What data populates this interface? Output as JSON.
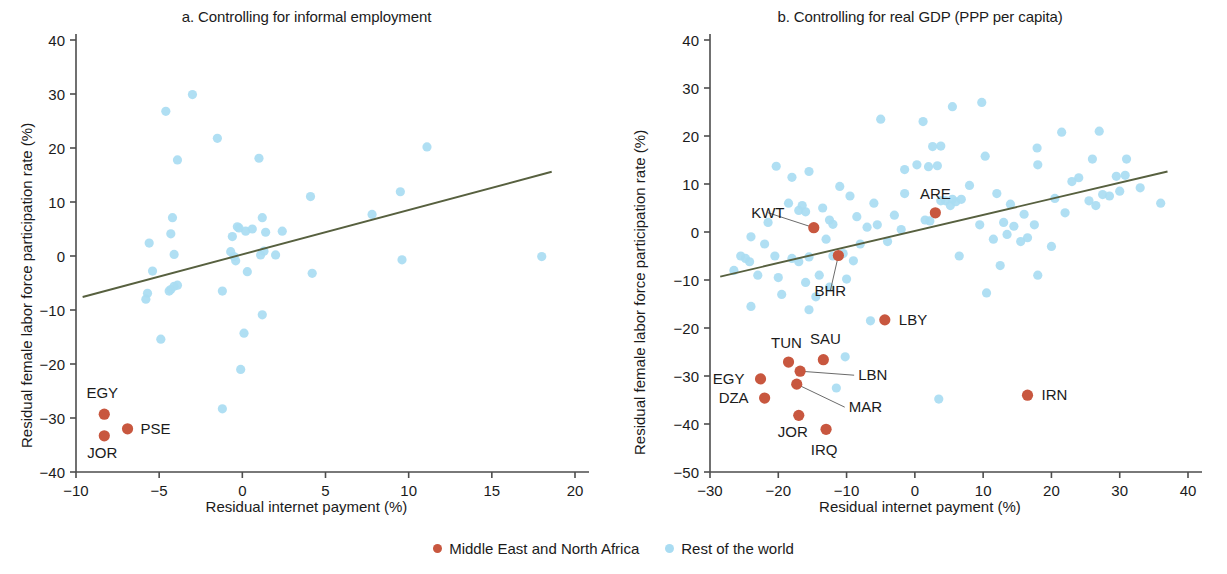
{
  "figure": {
    "xlabel": "Residual internet payment (%)",
    "ylabel": "Residual female labor force participation rate (%)",
    "colors": {
      "mena": "#c8573f",
      "rest_of_world": "#a9dcf2",
      "trendline": "#57603f",
      "axis": "#4d4d4d",
      "text": "#1b1b1b"
    }
  },
  "legend": {
    "items": [
      {
        "label": "Middle East and North Africa",
        "color": "#c8573f",
        "marker": "dot"
      },
      {
        "label": "Rest of the world",
        "color": "#a9dcf2",
        "marker": "dot"
      }
    ]
  },
  "chart_data": [
    {
      "id": "panel_a",
      "type": "scatter",
      "title": "a. Controlling for informal employment",
      "xlabel": "Residual internet payment (%)",
      "ylabel": "Residual female labor force participation rate (%)",
      "xlim": [
        -10,
        20
      ],
      "ylim": [
        -40,
        40
      ],
      "xticks": [
        -10,
        -5,
        0,
        5,
        10,
        15,
        20
      ],
      "yticks": [
        -40,
        -30,
        -20,
        -10,
        0,
        10,
        20,
        30,
        40
      ],
      "grid": false,
      "legend_position": "bottom-center",
      "trendline": {
        "x": [
          -9.6,
          18.6
        ],
        "y": [
          -7.6,
          15.6
        ],
        "color": "#57603f"
      },
      "series": [
        {
          "name": "Middle East and North Africa",
          "color": "#c8573f",
          "points": [
            {
              "label": "EGY",
              "x": -8.3,
              "y": -29.3,
              "label_dx": -2,
              "label_dy": -16,
              "label_anchor": "middle"
            },
            {
              "label": "JOR",
              "x": -8.3,
              "y": -33.3,
              "label_dx": -2,
              "label_dy": 22,
              "label_anchor": "middle"
            },
            {
              "label": "PSE",
              "x": -6.9,
              "y": -32.0,
              "label_dx": 13,
              "label_dy": 5,
              "label_anchor": "start"
            }
          ]
        },
        {
          "name": "Rest of the world",
          "color": "#a9dcf2",
          "points": [
            {
              "x": -3.0,
              "y": 29.9
            },
            {
              "x": -4.6,
              "y": 26.8
            },
            {
              "x": -1.5,
              "y": 21.8
            },
            {
              "x": 11.1,
              "y": 20.2
            },
            {
              "x": -3.9,
              "y": 17.8
            },
            {
              "x": 1.0,
              "y": 18.1
            },
            {
              "x": 4.1,
              "y": 11.0
            },
            {
              "x": 9.5,
              "y": 11.9
            },
            {
              "x": 7.8,
              "y": 7.7
            },
            {
              "x": -4.2,
              "y": 7.1
            },
            {
              "x": 1.2,
              "y": 7.1
            },
            {
              "x": -4.3,
              "y": 4.1
            },
            {
              "x": 2.4,
              "y": 4.6
            },
            {
              "x": -0.2,
              "y": 5.2
            },
            {
              "x": 0.2,
              "y": 4.6
            },
            {
              "x": -0.3,
              "y": 5.4
            },
            {
              "x": 0.6,
              "y": 5.0
            },
            {
              "x": 1.4,
              "y": 4.4
            },
            {
              "x": -0.6,
              "y": 3.6
            },
            {
              "x": -5.6,
              "y": 2.4
            },
            {
              "x": -0.7,
              "y": 0.8
            },
            {
              "x": -4.1,
              "y": 0.3
            },
            {
              "x": -0.5,
              "y": -0.1
            },
            {
              "x": -0.4,
              "y": -0.9
            },
            {
              "x": 1.1,
              "y": 0.2
            },
            {
              "x": 1.3,
              "y": 0.9
            },
            {
              "x": 2.0,
              "y": 0.2
            },
            {
              "x": 9.6,
              "y": -0.7
            },
            {
              "x": 18.0,
              "y": -0.1
            },
            {
              "x": 0.3,
              "y": -2.9
            },
            {
              "x": 4.2,
              "y": -3.2
            },
            {
              "x": -5.4,
              "y": -2.8
            },
            {
              "x": -4.4,
              "y": -6.5
            },
            {
              "x": -4.3,
              "y": -6.2
            },
            {
              "x": -5.7,
              "y": -6.9
            },
            {
              "x": -1.2,
              "y": -6.5
            },
            {
              "x": -4.1,
              "y": -5.6
            },
            {
              "x": -3.9,
              "y": -5.4
            },
            {
              "x": -5.8,
              "y": -8.0
            },
            {
              "x": 1.2,
              "y": -10.9
            },
            {
              "x": 0.1,
              "y": -14.3
            },
            {
              "x": -4.9,
              "y": -15.4
            },
            {
              "x": -0.1,
              "y": -21.0
            },
            {
              "x": -1.2,
              "y": -28.3
            }
          ]
        }
      ]
    },
    {
      "id": "panel_b",
      "type": "scatter",
      "title": "b. Controlling for real GDP (PPP per capita)",
      "xlabel": "Residual internet payment (%)",
      "ylabel": "Residual female labor force participation rate (%)",
      "xlim": [
        -30,
        40
      ],
      "ylim": [
        -50,
        40
      ],
      "xticks": [
        -30,
        -20,
        -10,
        0,
        10,
        20,
        30,
        40
      ],
      "yticks": [
        -50,
        -40,
        -30,
        -20,
        -10,
        0,
        10,
        20,
        30,
        40
      ],
      "grid": false,
      "legend_position": "bottom-center",
      "trendline": {
        "x": [
          -28.5,
          37.0
        ],
        "y": [
          -9.3,
          12.6
        ],
        "color": "#57603f"
      },
      "series": [
        {
          "name": "Middle East and North Africa",
          "color": "#c8573f",
          "points": [
            {
              "label": "ARE",
              "x": 3.0,
              "y": 4.0,
              "label_dx": 0,
              "label_dy": -14,
              "label_anchor": "middle"
            },
            {
              "label": "KWT",
              "x": -14.8,
              "y": 0.9,
              "label_dx": -46,
              "label_dy": -10,
              "label_anchor": "middle",
              "leader": true
            },
            {
              "label": "BHR",
              "x": -11.2,
              "y": -4.9,
              "label_dx": -8,
              "label_dy": 40,
              "label_anchor": "middle",
              "leader": true
            },
            {
              "label": "LBY",
              "x": -4.4,
              "y": -18.3,
              "label_dx": 14,
              "label_dy": 5,
              "label_anchor": "start"
            },
            {
              "label": "TUN",
              "x": -18.5,
              "y": -27.1,
              "label_dx": -2,
              "label_dy": -14,
              "label_anchor": "middle"
            },
            {
              "label": "SAU",
              "x": -13.4,
              "y": -26.6,
              "label_dx": 2,
              "label_dy": -16,
              "label_anchor": "middle"
            },
            {
              "label": "LBN",
              "x": -16.8,
              "y": -29.0,
              "label_dx": 58,
              "label_dy": 9,
              "label_anchor": "start",
              "leader": true
            },
            {
              "label": "EGY",
              "x": -22.6,
              "y": -30.6,
              "label_dx": -16,
              "label_dy": 5,
              "label_anchor": "end"
            },
            {
              "label": "MAR",
              "x": -17.3,
              "y": -31.7,
              "label_dx": 52,
              "label_dy": 28,
              "label_anchor": "start",
              "leader": true
            },
            {
              "label": "DZA",
              "x": -22.0,
              "y": -34.6,
              "label_dx": -16,
              "label_dy": 5,
              "label_anchor": "end"
            },
            {
              "label": "IRN",
              "x": 16.5,
              "y": -34.0,
              "label_dx": 14,
              "label_dy": 5,
              "label_anchor": "start"
            },
            {
              "label": "JOR",
              "x": -17.0,
              "y": -38.2,
              "label_dx": -6,
              "label_dy": 22,
              "label_anchor": "middle"
            },
            {
              "label": "IRQ",
              "x": -13.0,
              "y": -41.1,
              "label_dx": -2,
              "label_dy": 26,
              "label_anchor": "middle"
            }
          ]
        },
        {
          "name": "Rest of the world",
          "color": "#a9dcf2",
          "points": [
            {
              "x": 9.8,
              "y": 27.0
            },
            {
              "x": 5.5,
              "y": 26.1
            },
            {
              "x": -5.0,
              "y": 23.5
            },
            {
              "x": 1.2,
              "y": 23.0
            },
            {
              "x": 21.5,
              "y": 20.8
            },
            {
              "x": 3.8,
              "y": 17.9
            },
            {
              "x": 27.0,
              "y": 21.0
            },
            {
              "x": 2.6,
              "y": 17.8
            },
            {
              "x": 17.9,
              "y": 17.5
            },
            {
              "x": 0.3,
              "y": 14.0
            },
            {
              "x": 10.3,
              "y": 15.8
            },
            {
              "x": 18.0,
              "y": 14.0
            },
            {
              "x": -20.3,
              "y": 13.7
            },
            {
              "x": 26.0,
              "y": 15.2
            },
            {
              "x": 31.0,
              "y": 15.2
            },
            {
              "x": 2.0,
              "y": 13.6
            },
            {
              "x": -1.5,
              "y": 13.0
            },
            {
              "x": 3.3,
              "y": 13.8
            },
            {
              "x": -18.0,
              "y": 11.4
            },
            {
              "x": -15.5,
              "y": 12.6
            },
            {
              "x": 24.0,
              "y": 11.3
            },
            {
              "x": 29.5,
              "y": 11.6
            },
            {
              "x": 30.8,
              "y": 11.8
            },
            {
              "x": 23.0,
              "y": 10.5
            },
            {
              "x": 33.0,
              "y": 9.2
            },
            {
              "x": -11.0,
              "y": 9.5
            },
            {
              "x": 8.0,
              "y": 9.7
            },
            {
              "x": -9.5,
              "y": 7.5
            },
            {
              "x": -1.5,
              "y": 8.0
            },
            {
              "x": 12.0,
              "y": 8.0
            },
            {
              "x": 27.5,
              "y": 7.8
            },
            {
              "x": 28.5,
              "y": 7.5
            },
            {
              "x": 30.0,
              "y": 8.5
            },
            {
              "x": 20.5,
              "y": 7.0
            },
            {
              "x": 36.0,
              "y": 6.0
            },
            {
              "x": 5.5,
              "y": 6.8
            },
            {
              "x": -6.0,
              "y": 6.0
            },
            {
              "x": -16.5,
              "y": 5.5
            },
            {
              "x": -17.0,
              "y": 4.5
            },
            {
              "x": -16.0,
              "y": 4.2
            },
            {
              "x": -18.5,
              "y": 6.0
            },
            {
              "x": -13.5,
              "y": 5.0
            },
            {
              "x": -8.5,
              "y": 3.2
            },
            {
              "x": -3.0,
              "y": 3.5
            },
            {
              "x": 3.8,
              "y": 6.5
            },
            {
              "x": 4.5,
              "y": 6.5
            },
            {
              "x": 5.2,
              "y": 5.5
            },
            {
              "x": 6.0,
              "y": 6.3
            },
            {
              "x": 6.8,
              "y": 6.8
            },
            {
              "x": 14.0,
              "y": 5.8
            },
            {
              "x": 16.0,
              "y": 3.7
            },
            {
              "x": 22.0,
              "y": 4.0
            },
            {
              "x": 25.5,
              "y": 6.5
            },
            {
              "x": 26.5,
              "y": 5.5
            },
            {
              "x": -21.5,
              "y": 2.0
            },
            {
              "x": -12.5,
              "y": 2.5
            },
            {
              "x": -12.0,
              "y": 1.6
            },
            {
              "x": -7.0,
              "y": 1.0
            },
            {
              "x": -5.5,
              "y": 1.5
            },
            {
              "x": -2.0,
              "y": 0.5
            },
            {
              "x": 1.5,
              "y": 2.5
            },
            {
              "x": 2.2,
              "y": 2.3
            },
            {
              "x": 9.5,
              "y": 1.5
            },
            {
              "x": 13.0,
              "y": 2.0
            },
            {
              "x": 14.5,
              "y": 1.2
            },
            {
              "x": 17.5,
              "y": 1.5
            },
            {
              "x": -24.0,
              "y": -1.0
            },
            {
              "x": -22.0,
              "y": -2.5
            },
            {
              "x": -13.0,
              "y": -1.5
            },
            {
              "x": -8.0,
              "y": -2.5
            },
            {
              "x": -4.0,
              "y": -2.0
            },
            {
              "x": 11.5,
              "y": -1.5
            },
            {
              "x": 13.5,
              "y": -0.5
            },
            {
              "x": 15.5,
              "y": -2.0
            },
            {
              "x": 16.5,
              "y": -1.2
            },
            {
              "x": 20.0,
              "y": -3.0
            },
            {
              "x": -25.5,
              "y": -5.0
            },
            {
              "x": -24.8,
              "y": -5.5
            },
            {
              "x": -24.2,
              "y": -6.2
            },
            {
              "x": -20.5,
              "y": -5.0
            },
            {
              "x": -18.0,
              "y": -5.5
            },
            {
              "x": -17.0,
              "y": -6.2
            },
            {
              "x": -15.5,
              "y": -5.2
            },
            {
              "x": -12.0,
              "y": -5.0
            },
            {
              "x": -10.5,
              "y": -4.5
            },
            {
              "x": -9.0,
              "y": -6.0
            },
            {
              "x": 6.5,
              "y": -5.0
            },
            {
              "x": 12.5,
              "y": -7.0
            },
            {
              "x": 18.0,
              "y": -9.0
            },
            {
              "x": -26.5,
              "y": -8.0
            },
            {
              "x": -23.0,
              "y": -9.0
            },
            {
              "x": -20.0,
              "y": -9.5
            },
            {
              "x": -14.0,
              "y": -9.0
            },
            {
              "x": -10.0,
              "y": -9.8
            },
            {
              "x": -16.0,
              "y": -10.5
            },
            {
              "x": -12.5,
              "y": -11.5
            },
            {
              "x": -14.5,
              "y": -13.5
            },
            {
              "x": 10.5,
              "y": -12.7
            },
            {
              "x": -24.0,
              "y": -15.5
            },
            {
              "x": -19.5,
              "y": -13.0
            },
            {
              "x": -15.5,
              "y": -16.2
            },
            {
              "x": -6.5,
              "y": -18.5
            },
            {
              "x": -10.2,
              "y": -26.0
            },
            {
              "x": -11.5,
              "y": -32.5
            },
            {
              "x": 3.5,
              "y": -34.8
            }
          ]
        }
      ]
    }
  ]
}
